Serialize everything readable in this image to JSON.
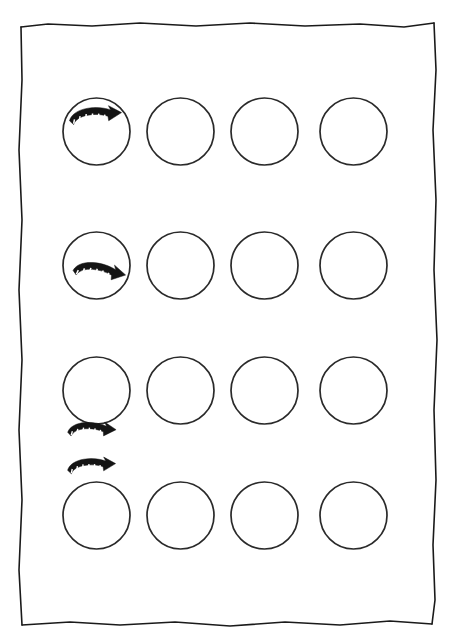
{
  "figure": {
    "background_color": "#ffffff",
    "ink_color": "#1a1a1a",
    "width": 454,
    "height": 642
  },
  "frame": {
    "name": "hand-drawn-border",
    "style": "sketchy-rectangle",
    "stroke_color": "#1a1a1a",
    "left": 20,
    "top": 22,
    "right": 436,
    "bottom": 626
  },
  "grid": {
    "rows": 4,
    "columns": 4,
    "circle_radius": 33.5,
    "column_centers": [
      96.5,
      180.5,
      264.5,
      353.5
    ],
    "row_centers": [
      131.5,
      265.5,
      390.5,
      515.5
    ],
    "circle_fill": "#ffffff",
    "circle_stroke": "#2a2a2a"
  },
  "arrows": [
    {
      "id": "arrow-row-1",
      "label": "curved-arrow-inside-top",
      "row": 1,
      "column": 1,
      "position": "inside-circle-upper",
      "direction": "clockwise-right",
      "center_x": 96,
      "center_y": 120,
      "rotation": -4,
      "scale": 1.0,
      "color": "#141414"
    },
    {
      "id": "arrow-row-2",
      "label": "curved-arrow-inside-bottom",
      "row": 2,
      "column": 1,
      "position": "inside-circle-lower",
      "direction": "clockwise-right",
      "center_x": 99,
      "center_y": 276,
      "rotation": 10,
      "scale": 1.0,
      "color": "#141414"
    },
    {
      "id": "arrow-row-3",
      "label": "curved-arrow-below-circle",
      "row": 3,
      "column": 1,
      "position": "below-circle",
      "direction": "clockwise-right",
      "center_x": 92,
      "center_y": 434,
      "rotation": 2,
      "scale": 0.92,
      "color": "#141414"
    },
    {
      "id": "arrow-row-4",
      "label": "curved-arrow-above-circle",
      "row": 4,
      "column": 1,
      "position": "above-circle",
      "direction": "clockwise-right",
      "center_x": 92,
      "center_y": 470,
      "rotation": -3,
      "scale": 0.92,
      "color": "#141414"
    }
  ],
  "arrow_glyph": {
    "name": "curved-segmented-arrow",
    "segment_ticks": 6,
    "tick_color": "#ffffff",
    "body_color": "#141414",
    "description": "thick curved band with white segment ticks and solid arrowhead at right end"
  }
}
